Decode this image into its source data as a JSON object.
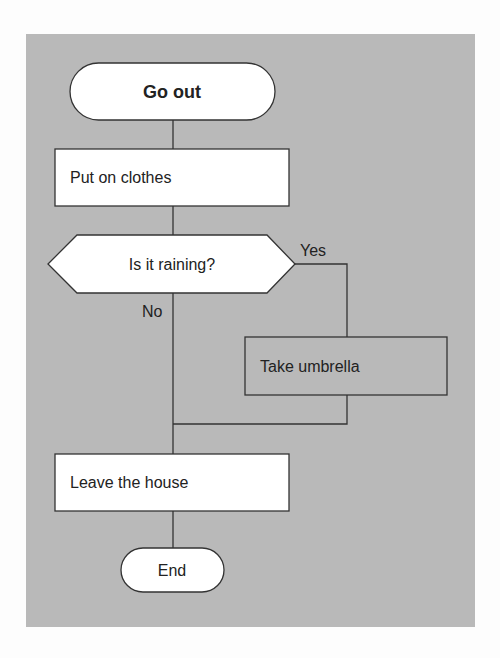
{
  "diagram": {
    "type": "flowchart",
    "nodes": {
      "start": {
        "shape": "terminal",
        "label": "Go out"
      },
      "clothes": {
        "shape": "process",
        "label": "Put on clothes"
      },
      "decision": {
        "shape": "decision",
        "label": "Is it raining?"
      },
      "umbrella": {
        "shape": "process",
        "label": "Take umbrella"
      },
      "leave": {
        "shape": "process",
        "label": "Leave the house"
      },
      "end": {
        "shape": "terminal",
        "label": "End"
      }
    },
    "edges": {
      "yes": {
        "from": "decision",
        "to": "umbrella",
        "label": "Yes"
      },
      "no": {
        "from": "decision",
        "to": "leave",
        "label": "No"
      }
    },
    "colors": {
      "panel": "#b9b9b9",
      "node_fill": "#ffffff",
      "umbrella_fill": "#b9b9b9",
      "stroke": "#333333"
    }
  }
}
